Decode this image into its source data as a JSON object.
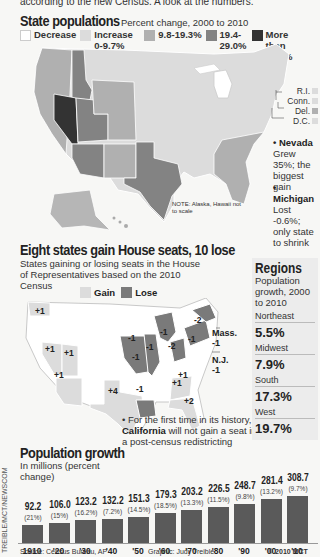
{
  "intro": "according to the new Census. A look at the numbers.",
  "state_populations": {
    "title": "State populations",
    "subtitle": "Percent change, 2000 to 2010",
    "legend": [
      {
        "label": "Decrease",
        "color": "#ffffff"
      },
      {
        "label": "Increase 0-9.7%",
        "color": "#dcdcdc"
      },
      {
        "label": "9.8-19.3%",
        "color": "#b0b0b0"
      },
      {
        "label": "19.4-29.0%",
        "color": "#838383"
      },
      {
        "label": "More than 29.1%",
        "color": "#333333"
      }
    ],
    "small_states": [
      {
        "label": "R.I.",
        "color": "#dcdcdc"
      },
      {
        "label": "Conn.",
        "color": "#dcdcdc"
      },
      {
        "label": "Del.",
        "color": "#b0b0b0"
      },
      {
        "label": "D.C.",
        "color": "#dcdcdc"
      }
    ],
    "notes": [
      {
        "state": "Nevada",
        "text": "Grew 35%; the biggest gain"
      },
      {
        "state": "Michigan",
        "text": "Lost -0.6%; only state to shrink"
      }
    ],
    "map_note": "NOTE: Alaska, Hawaii not to scale"
  },
  "house_seats": {
    "title": "Eight states gain House seats, 10 lose",
    "subtitle": "States gaining or losing seats in the House of Representatives based on the 2010 Census",
    "legend": [
      {
        "label": "Gain",
        "color": "#dcdcdc"
      },
      {
        "label": "Lose",
        "color": "#7a7a7a"
      }
    ],
    "labels": [
      {
        "state": "Washington",
        "change": "+1"
      },
      {
        "state": "Nevada",
        "change": "+1"
      },
      {
        "state": "Utah",
        "change": "+1"
      },
      {
        "state": "Arizona",
        "change": "+1"
      },
      {
        "state": "Texas",
        "change": "+4"
      },
      {
        "state": "Iowa",
        "change": "-1"
      },
      {
        "state": "Missouri",
        "change": "-1"
      },
      {
        "state": "Illinois",
        "change": "-1"
      },
      {
        "state": "Michigan",
        "change": "-1"
      },
      {
        "state": "Ohio",
        "change": "-2"
      },
      {
        "state": "Pennsylvania",
        "change": "-1"
      },
      {
        "state": "New York",
        "change": "-2"
      },
      {
        "state": "Louisiana",
        "change": "-1"
      },
      {
        "state": "South Carolina",
        "change": "+1"
      },
      {
        "state": "Georgia",
        "change": "+1"
      },
      {
        "state": "Florida",
        "change": "+2"
      },
      {
        "state": "Mass.",
        "change": "-1"
      },
      {
        "state": "N.J.",
        "change": "-1"
      }
    ],
    "california_note_bold": "California",
    "california_note_pre": "• For the first time in its history,",
    "california_note_post": "will not gain a seat in a post-census redistricting"
  },
  "regions": {
    "title": "Regions",
    "subtitle": "Population growth, 2000 to 2010",
    "items": [
      {
        "name": "Northeast",
        "value": "5.5%"
      },
      {
        "name": "Midwest",
        "value": "7.9%"
      },
      {
        "name": "South",
        "value": "17.3%"
      },
      {
        "name": "West",
        "value": "19.7%"
      }
    ]
  },
  "chart_data": {
    "type": "bar",
    "title": "Population growth",
    "ylabel": "In millions (percent change)",
    "xlabel": "",
    "categories": [
      "1910",
      "'20",
      "'30",
      "'40",
      "'50",
      "'60",
      "'70",
      "'80",
      "'90",
      "'00",
      "'10"
    ],
    "values": [
      92.2,
      106.0,
      123.2,
      132.2,
      151.3,
      179.3,
      203.2,
      226.5,
      248.7,
      281.4,
      308.7
    ],
    "value_labels": [
      "92.2",
      "106.0",
      "123.2",
      "132.2",
      "151.3",
      "179.3",
      "203.2",
      "226.5",
      "248.7",
      "281.4",
      "308.7"
    ],
    "percent_change": [
      "(21%)",
      "(15%)",
      "(16.2%)",
      "(7.2%)",
      "(14.5%)",
      "(18.5%)",
      "(13.3%)",
      "(11.5%)",
      "(9.8%)",
      "(13.2%)",
      "(9.7%)"
    ],
    "grid": false,
    "legend": "none"
  },
  "footer": {
    "source": "Source: Census Bureau, AP",
    "graphic": "Graphic: Judy Treible",
    "copyright": "© 2010 MCT",
    "credit": "TREIBLE/MCT/NEWSCOM"
  }
}
